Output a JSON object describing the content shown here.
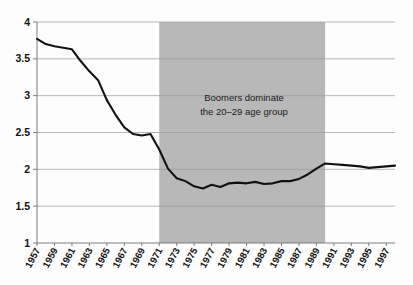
{
  "chart_data": {
    "type": "line",
    "title": "",
    "subtitle": "",
    "xlabel": "",
    "ylabel": "",
    "xlim": [
      1957,
      1998
    ],
    "ylim": [
      1,
      4
    ],
    "grid": true,
    "legend": false,
    "legend_position": "none",
    "y_ticks": [
      "4",
      "3.5",
      "3",
      "2.5",
      "2",
      "1.5",
      "1"
    ],
    "y_tick_values": [
      4,
      3.5,
      3,
      2.5,
      2,
      1.5,
      1
    ],
    "x_ticks": [
      "1957",
      "1959",
      "1961",
      "1963",
      "1965",
      "1967",
      "1969",
      "1971",
      "1973",
      "1975",
      "1977",
      "1979",
      "1981",
      "1983",
      "1985",
      "1987",
      "1989",
      "1991",
      "1993",
      "1995",
      "1997"
    ],
    "x_tick_values": [
      1957,
      1959,
      1961,
      1963,
      1965,
      1967,
      1969,
      1971,
      1973,
      1975,
      1977,
      1979,
      1981,
      1983,
      1985,
      1987,
      1989,
      1991,
      1993,
      1995,
      1997
    ],
    "line_color": "#111111",
    "series": [
      {
        "name": "",
        "x": [
          1957,
          1958,
          1959,
          1960,
          1961,
          1962,
          1963,
          1964,
          1965,
          1966,
          1967,
          1968,
          1969,
          1970,
          1971,
          1972,
          1973,
          1974,
          1975,
          1976,
          1977,
          1978,
          1979,
          1980,
          1981,
          1982,
          1983,
          1984,
          1985,
          1986,
          1987,
          1988,
          1989,
          1990,
          1991,
          1992,
          1993,
          1994,
          1995,
          1996,
          1997,
          1998
        ],
        "values": [
          3.77,
          3.7,
          3.67,
          3.65,
          3.63,
          3.47,
          3.33,
          3.21,
          2.94,
          2.74,
          2.57,
          2.48,
          2.46,
          2.48,
          2.27,
          2.01,
          1.88,
          1.84,
          1.77,
          1.74,
          1.79,
          1.76,
          1.81,
          1.82,
          1.81,
          1.83,
          1.8,
          1.81,
          1.84,
          1.84,
          1.87,
          1.93,
          2.01,
          2.08,
          2.07,
          2.06,
          2.05,
          2.04,
          2.02,
          2.03,
          2.04,
          2.05
        ]
      }
    ],
    "annotations": [
      {
        "name": "boomer-shading-band",
        "type": "shaded-region",
        "x_start": 1971,
        "x_end": 1990,
        "color": "#b8b8b8",
        "label_line1": "Boomers dominate",
        "label_line2": "the 20–29 age group"
      }
    ]
  }
}
